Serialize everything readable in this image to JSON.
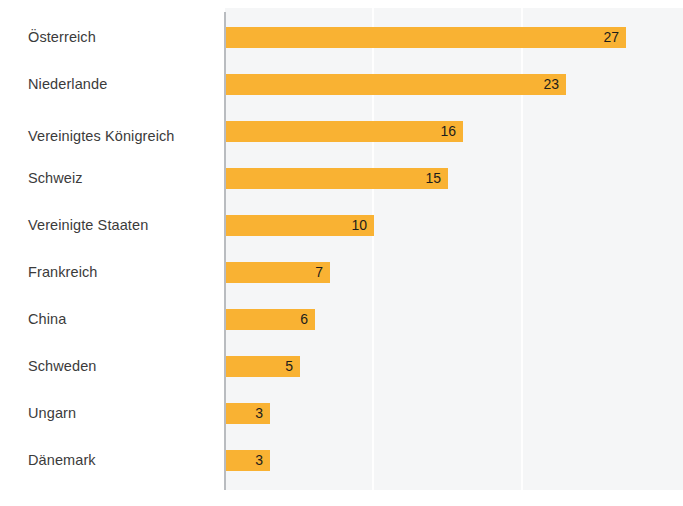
{
  "chart_data": {
    "type": "bar",
    "orientation": "horizontal",
    "title": "",
    "subtitle": "",
    "xlabel": "",
    "ylabel": "",
    "xlim": [
      0,
      31
    ],
    "grid": true,
    "gridlines_at": [
      10,
      20
    ],
    "legend": null,
    "categories": [
      "Österreich",
      "Niederlande",
      "Vereinigtes Königreich",
      "Schweiz",
      "Vereinigte Staaten",
      "Frankreich",
      "China",
      "Schweden",
      "Ungarn",
      "Dänemark"
    ],
    "values": [
      27,
      23,
      16,
      15,
      10,
      7,
      6,
      5,
      3,
      3
    ],
    "bars": [
      {
        "category": "Österreich",
        "value": 27,
        "value_label": "27",
        "footnote": ""
      },
      {
        "category": "Niederlande",
        "value": 23,
        "value_label": "23",
        "footnote": ""
      },
      {
        "category": "Vereinigtes Königreich",
        "value": 16,
        "value_label": "16",
        "footnote": "|1"
      },
      {
        "category": "Schweiz",
        "value": 15,
        "value_label": "15",
        "footnote": ""
      },
      {
        "category": "Vereinigte Staaten",
        "value": 10,
        "value_label": "10",
        "footnote": ""
      },
      {
        "category": "Frankreich",
        "value": 7,
        "value_label": "7",
        "footnote": ""
      },
      {
        "category": "China",
        "value": 6,
        "value_label": "6",
        "footnote": ""
      },
      {
        "category": "Schweden",
        "value": 5,
        "value_label": "5",
        "footnote": ""
      },
      {
        "category": "Ungarn",
        "value": 3,
        "value_label": "3",
        "footnote": ""
      },
      {
        "category": "Dänemark",
        "value": 3,
        "value_label": "3",
        "footnote": ""
      }
    ]
  },
  "colors": {
    "bar": "#f9b233",
    "panel_background": "#f5f6f7",
    "page_background": "#ffffff",
    "axis_line": "#b9bcc0",
    "gridline": "#ffffff",
    "label_text": "#3b3b3b",
    "value_text": "#1d1d1b"
  },
  "footer": {
    "caption": ""
  }
}
